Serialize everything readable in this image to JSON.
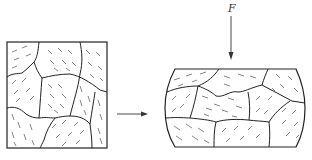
{
  "diagram": {
    "force_label": "F",
    "initial_state": "undeformed-grain-structure",
    "final_state": "compressed-grain-structure",
    "colors": {
      "line": "#222222",
      "hatch": "#555555",
      "background": "#ffffff"
    }
  }
}
